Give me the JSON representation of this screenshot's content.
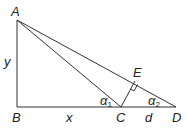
{
  "diagram": {
    "points": {
      "A": {
        "label": "A",
        "x": 17,
        "y": 20
      },
      "B": {
        "label": "B",
        "x": 17,
        "y": 107
      },
      "C": {
        "label": "C",
        "x": 121,
        "y": 107
      },
      "D": {
        "label": "D",
        "x": 176,
        "y": 107
      },
      "E": {
        "label": "E",
        "x": 136,
        "y": 90
      }
    },
    "segment_labels": {
      "AB": "y",
      "BC": "x",
      "CD": "d"
    },
    "angles": {
      "alpha1": {
        "symbol": "α",
        "sub": "1"
      },
      "alpha2": {
        "symbol": "α",
        "sub": "2"
      }
    },
    "line_color": "#333333"
  }
}
